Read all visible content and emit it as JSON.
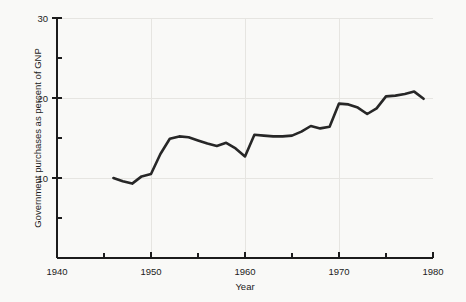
{
  "chart_data": {
    "type": "line",
    "title": "",
    "xlabel": "Year",
    "ylabel": "Government purchases as percent of GNP",
    "xlim": [
      1940,
      1980
    ],
    "ylim": [
      0,
      30
    ],
    "grid": true,
    "legend": null,
    "x_major_ticks": [
      1940,
      1950,
      1960,
      1970,
      1980
    ],
    "x_minor_ticks": [
      1945,
      1955,
      1965,
      1975
    ],
    "x_tick_labels": [
      "1940",
      "1950",
      "1960",
      "1970",
      "1980"
    ],
    "y_major_ticks": [
      10,
      20,
      30
    ],
    "y_minor_ticks": [
      5,
      15,
      25
    ],
    "y_tick_labels": [
      "10",
      "20",
      "30"
    ],
    "series": [
      {
        "name": "Government purchases as percent of GNP",
        "color": "#272727",
        "x": [
          1946,
          1947,
          1948,
          1949,
          1950,
          1951,
          1952,
          1953,
          1954,
          1955,
          1956,
          1957,
          1958,
          1959,
          1960,
          1961,
          1962,
          1963,
          1964,
          1965,
          1966,
          1967,
          1968,
          1969,
          1970,
          1971,
          1972,
          1973,
          1974,
          1975,
          1976,
          1977,
          1978,
          1979
        ],
        "values": [
          10.0,
          9.6,
          9.3,
          10.2,
          10.5,
          13.0,
          14.9,
          15.2,
          15.1,
          14.7,
          14.3,
          14.0,
          14.4,
          13.7,
          12.7,
          15.4,
          15.3,
          15.2,
          15.2,
          15.3,
          15.8,
          16.5,
          16.2,
          16.4,
          19.3,
          19.2,
          18.8,
          18.0,
          18.7,
          20.2,
          20.3,
          20.5,
          20.8,
          19.9
        ]
      }
    ]
  },
  "axes": {
    "x_axis_title": "Year",
    "y_axis_title": "Government purchases as percent of GNP"
  }
}
